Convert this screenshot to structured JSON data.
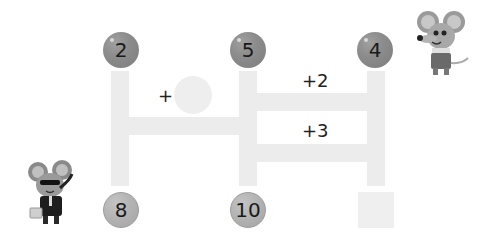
{
  "puzzle": {
    "top_numbers": [
      "2",
      "5",
      "4"
    ],
    "bottom_numbers": [
      "8",
      "10",
      ""
    ],
    "operations": {
      "left_blank": "+",
      "right_top": "+2",
      "right_bottom": "+3"
    },
    "blanks": {
      "left_circle": "",
      "bottom_right_square": ""
    }
  },
  "characters": [
    {
      "name": "mouse-with-overalls",
      "position": "top-right"
    },
    {
      "name": "mouse-with-sunglasses-and-briefcase",
      "position": "bottom-left"
    }
  ],
  "colors": {
    "bar": "#ececec",
    "top_ball": "#8c8c8c",
    "bottom_ball": "#b2b2b2",
    "blank": "#eeeeee"
  }
}
